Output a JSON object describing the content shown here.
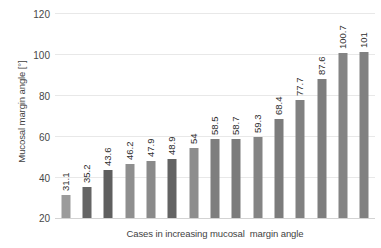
{
  "chart_data": {
    "type": "bar",
    "title": "",
    "xlabel": "Cases in increasing mucosal  margin angle",
    "ylabel": "Mucosal margin angle [°]",
    "ylim": [
      20,
      120
    ],
    "yticks": [
      20,
      40,
      60,
      80,
      100,
      120
    ],
    "grid": true,
    "legend": "none",
    "categories": [
      "1",
      "2",
      "3",
      "4",
      "5",
      "6",
      "7",
      "8",
      "9",
      "10",
      "11",
      "12",
      "13",
      "14",
      "15"
    ],
    "values": [
      31.1,
      35.2,
      43.6,
      46.2,
      47.9,
      48.9,
      54,
      58.5,
      58.7,
      59.3,
      68.4,
      77.7,
      87.6,
      100.7,
      101
    ],
    "labels": [
      "31.1",
      "35.2",
      "43.6",
      "46.2",
      "47.9",
      "48.9",
      "54",
      "58.5",
      "58.7",
      "59.3",
      "68.4",
      "77.7",
      "87.6",
      "100.7",
      "101"
    ],
    "bar_colors": [
      "#9b9b9b",
      "#656565",
      "#5f5f5f",
      "#8f8f8f",
      "#8a8a8a",
      "#636363",
      "#8d8d8d",
      "#7e7e7e",
      "#7b7b7b",
      "#848484",
      "#7c7c7c",
      "#818181",
      "#7e7e7e",
      "#848484",
      "#818181"
    ],
    "axis_color": "#d3d3d3",
    "grid_color": "#e8e8e8",
    "tick_label_color": "#484848"
  },
  "yticks": {
    "t120": "120",
    "t100": "100",
    "t80": "80",
    "t60": "60",
    "t40": "40",
    "t20": "20"
  },
  "axis_titles": {
    "y": "Mucosal margin angle [°]",
    "x": "Cases in increasing mucosal  margin angle"
  }
}
